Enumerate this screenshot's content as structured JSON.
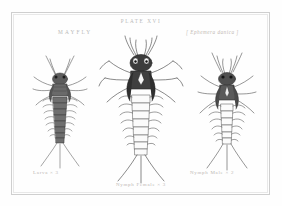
{
  "plate": {
    "number": "PLATE XVI",
    "common_name": "MAYFLY",
    "scientific_name": "[ Ephemera danica ]",
    "frame_color": "#cfcfcf",
    "paper_color": "#fefefe",
    "ink_color": "#3a3a3a",
    "label_color": "#b9b9b9"
  },
  "figures": [
    {
      "id": "larva",
      "caption": "Larva × 3",
      "position": "left",
      "magnification": "× 3",
      "stage": "Larva"
    },
    {
      "id": "nymph-female",
      "caption": "Nymph Female × 3",
      "position": "center",
      "magnification": "× 3",
      "stage": "Nymph Female"
    },
    {
      "id": "nymph-male",
      "caption": "Nymph Male × 2",
      "position": "right",
      "magnification": "× 2",
      "stage": "Nymph Male"
    }
  ]
}
